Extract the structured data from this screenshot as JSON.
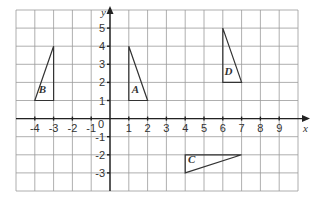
{
  "diagram": {
    "type": "coordinate-grid",
    "x_range": [
      -5,
      10
    ],
    "y_range": [
      -4,
      6
    ],
    "x_axis_label": "x",
    "y_axis_label": "y",
    "origin_label": "0",
    "x_ticks": [
      "-4",
      "-3",
      "-2",
      "-1",
      "1",
      "2",
      "3",
      "4",
      "5",
      "6",
      "7",
      "8",
      "9"
    ],
    "x_tick_values": [
      -4,
      -3,
      -2,
      -1,
      1,
      2,
      3,
      4,
      5,
      6,
      7,
      8,
      9
    ],
    "y_ticks": [
      "5",
      "4",
      "3",
      "2",
      "1",
      "-1",
      "-2",
      "-3"
    ],
    "y_tick_values": [
      5,
      4,
      3,
      2,
      1,
      -1,
      -2,
      -3
    ],
    "colors": {
      "grid": "#9a9a9a",
      "axis": "#222222",
      "shape": "#333333"
    },
    "shapes": [
      {
        "name": "A",
        "vertices": [
          [
            1,
            1
          ],
          [
            1,
            4
          ],
          [
            2,
            1
          ]
        ],
        "label_pos": [
          1.35,
          1.4
        ]
      },
      {
        "name": "B",
        "vertices": [
          [
            -4,
            1
          ],
          [
            -3,
            4
          ],
          [
            -3,
            1
          ]
        ],
        "label_pos": [
          -3.6,
          1.4
        ]
      },
      {
        "name": "C",
        "vertices": [
          [
            4,
            -2
          ],
          [
            7,
            -2
          ],
          [
            4,
            -3
          ]
        ],
        "label_pos": [
          4.35,
          -2.45
        ]
      },
      {
        "name": "D",
        "vertices": [
          [
            6,
            2
          ],
          [
            6,
            5
          ],
          [
            7,
            2
          ]
        ],
        "label_pos": [
          6.3,
          2.4
        ]
      }
    ]
  }
}
